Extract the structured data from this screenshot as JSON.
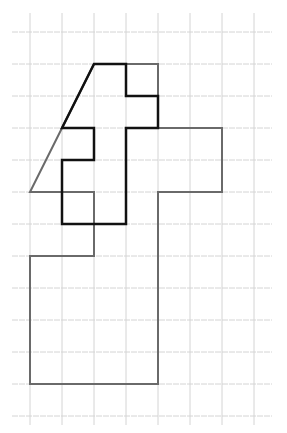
{
  "diagram": {
    "type": "grid-figures",
    "background": "#ffffff",
    "grid": {
      "cell_size_px": 32,
      "origin_px": [
        30,
        32
      ],
      "x_lines_px": [
        30,
        62,
        94,
        126,
        158,
        190,
        222,
        254
      ],
      "y_lines_px": [
        32,
        64,
        96,
        128,
        160,
        192,
        224,
        256,
        288,
        320,
        352,
        384,
        416
      ],
      "x_extent_px": [
        12,
        272
      ],
      "y_extent_px": [
        13,
        425
      ],
      "color": "#d4d4d4"
    },
    "figures": [
      {
        "name": "gray-figure",
        "stroke": "#6a6a6a",
        "stroke_width": 2,
        "points_grid": [
          [
            2,
            1
          ],
          [
            4,
            1
          ],
          [
            4,
            3
          ],
          [
            6,
            3
          ],
          [
            6,
            5
          ],
          [
            4,
            5
          ],
          [
            4,
            11
          ],
          [
            0,
            11
          ],
          [
            0,
            7
          ],
          [
            2,
            7
          ],
          [
            2,
            5
          ],
          [
            0,
            5
          ],
          [
            1,
            3
          ]
        ]
      },
      {
        "name": "black-figure",
        "stroke": "#111111",
        "stroke_width": 2.5,
        "points_grid": [
          [
            2,
            1
          ],
          [
            3,
            1
          ],
          [
            3,
            2
          ],
          [
            4,
            2
          ],
          [
            4,
            3
          ],
          [
            3,
            3
          ],
          [
            3,
            6
          ],
          [
            1,
            6
          ],
          [
            1,
            4
          ],
          [
            2,
            4
          ],
          [
            2,
            3
          ],
          [
            1,
            3
          ]
        ]
      }
    ]
  }
}
